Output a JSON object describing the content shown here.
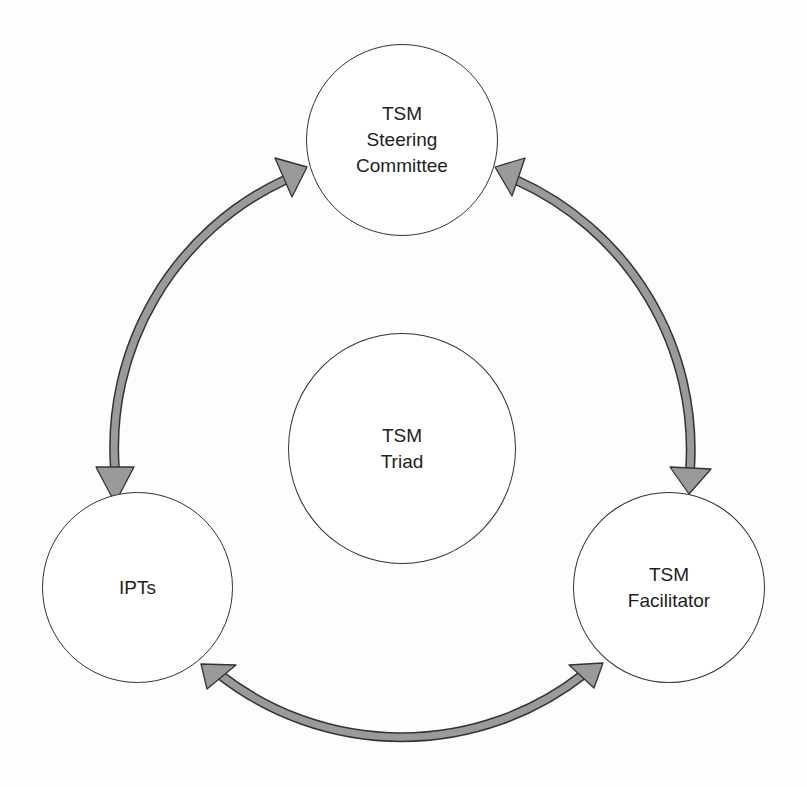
{
  "diagram": {
    "type": "cycle",
    "nodes": {
      "steering": {
        "line1": "TSM",
        "line2": "Steering",
        "line3": "Committee"
      },
      "triad": {
        "line1": "TSM",
        "line2": "Triad"
      },
      "ipts": {
        "line1": "IPTs"
      },
      "facilitator": {
        "line1": "TSM",
        "line2": "Facilitator"
      }
    },
    "edges": [
      {
        "from": "TSM Steering Committee",
        "to": "IPTs",
        "direction": "bidirectional"
      },
      {
        "from": "TSM Steering Committee",
        "to": "TSM Facilitator",
        "direction": "bidirectional"
      },
      {
        "from": "IPTs",
        "to": "TSM Facilitator",
        "direction": "bidirectional"
      }
    ],
    "colors": {
      "arrow_fill": "#9a9a9a",
      "outline": "#333333",
      "background": "#ffffff"
    }
  }
}
